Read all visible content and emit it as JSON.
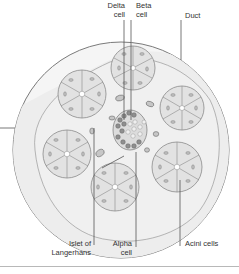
{
  "diagram": {
    "colors": {
      "tissue_fill": "#efefef",
      "outline": "#7a7a7a",
      "acinus_fill": "#e2e2e2",
      "cell_stroke": "#8a8a8a",
      "islet_fill": "#d4d4d4",
      "islet_dark": "#6e6e6e",
      "leader_line": "#555555",
      "text": "#333333"
    },
    "labels": {
      "delta_cell": [
        "Delta",
        "cell"
      ],
      "beta_cell": [
        "Beta",
        "cell"
      ],
      "duct": "Duct",
      "islet": [
        "Islet of",
        "Langerhans"
      ],
      "alpha_cell": [
        "Alpha",
        "cell"
      ],
      "acini_cells": "Acini cells"
    }
  }
}
